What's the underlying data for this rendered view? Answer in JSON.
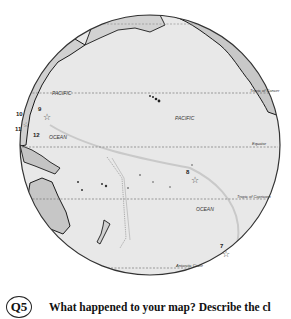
{
  "map": {
    "ocean_labels": [
      {
        "text": "PACIFIC",
        "x": 52,
        "y": 95
      },
      {
        "text": "PACIFIC",
        "x": 175,
        "y": 120
      },
      {
        "text": "OCEAN",
        "x": 49,
        "y": 139
      },
      {
        "text": "OCEAN",
        "x": 196,
        "y": 211
      }
    ],
    "line_labels": {
      "tropic_cancer": "Tropic of Cancer",
      "equator": "Equator",
      "tropic_capricorn": "Tropic of Capricorn",
      "antarctic_circle": "Antarctic Circle"
    },
    "markers": [
      {
        "id": "7",
        "label_x": 220,
        "label_y": 248,
        "star_x": 226,
        "star_y": 253
      },
      {
        "id": "8",
        "label_x": 186,
        "label_y": 174,
        "star_x": 195,
        "star_y": 179
      },
      {
        "id": "9",
        "label_x": 38,
        "label_y": 111,
        "star_x": 47,
        "star_y": 116
      },
      {
        "id": "10",
        "label_x": 16,
        "label_y": 116,
        "star_x": null,
        "star_y": null
      },
      {
        "id": "11",
        "label_x": 15,
        "label_y": 131,
        "star_x": null,
        "star_y": null
      },
      {
        "id": "12",
        "label_x": 33,
        "label_y": 137,
        "star_x": null,
        "star_y": null
      }
    ],
    "colors": {
      "ocean": "#e6e6e6",
      "land": "#c8c8c8",
      "coast": "#1a1a1a",
      "graticule": "#777777",
      "track": "#c9c9c9"
    }
  },
  "question": {
    "badge": "Q5",
    "text": "What happened to your map? Describe the cl"
  }
}
